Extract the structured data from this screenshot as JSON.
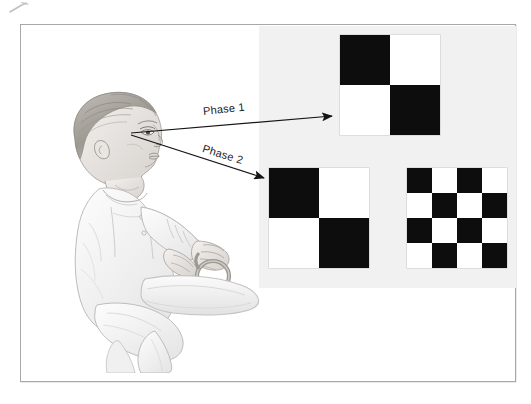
{
  "figure": {
    "kind": "scientific-illustration",
    "frame": {
      "border_color": "#a8a8a8",
      "background_color": "#ffffff"
    },
    "stimulus_panel": {
      "name": "stimulus-backdrop",
      "background_color": "#f1f1f1"
    },
    "colors": {
      "black": "#0d0d0d",
      "white": "#ffffff",
      "panel_gray": "#f1f1f1",
      "line": "#1b1b1b",
      "frame": "#a8a8a8",
      "pencil": "#b9b9b9"
    }
  },
  "arrows": [
    {
      "id": "phase-1",
      "label": "Phase 1",
      "from": "infant-face",
      "to": "stimulus-phase1"
    },
    {
      "id": "phase-2",
      "label": "Phase 2",
      "from": "infant-face",
      "to": "stimulus-phase2-coarse"
    }
  ],
  "stimuli": [
    {
      "id": "stimulus-phase1",
      "phase": "Phase 1",
      "name": "checkerboard-2x2",
      "rows": 2,
      "cols": 2,
      "grid": [
        [
          "black",
          "white"
        ],
        [
          "white",
          "black"
        ]
      ]
    },
    {
      "id": "stimulus-phase2-coarse",
      "phase": "Phase 2",
      "name": "checkerboard-2x2",
      "rows": 2,
      "cols": 2,
      "grid": [
        [
          "black",
          "white"
        ],
        [
          "white",
          "black"
        ]
      ]
    },
    {
      "id": "stimulus-phase2-fine",
      "phase": "Phase 2",
      "name": "checkerboard-4x4",
      "rows": 4,
      "cols": 4,
      "grid": [
        [
          "black",
          "white",
          "black",
          "white"
        ],
        [
          "white",
          "black",
          "white",
          "black"
        ],
        [
          "black",
          "white",
          "black",
          "white"
        ],
        [
          "white",
          "black",
          "white",
          "black"
        ]
      ]
    }
  ],
  "infant": {
    "name": "infant-in-seat",
    "orientation": "profile-facing-right",
    "holding": "ring-toy"
  },
  "artifact": {
    "name": "scan-artifact",
    "visible": true
  }
}
